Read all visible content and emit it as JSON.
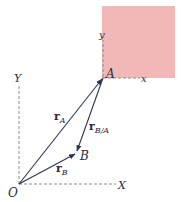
{
  "diagram": {
    "type": "relative-position-vectors",
    "colors": {
      "body_fill": "#f2b8b8",
      "vector": "#2b3550",
      "axis": "#8a8a95",
      "text": "#2a2a3a"
    },
    "points": {
      "origin": "O",
      "a": "A",
      "b": "B"
    },
    "fixed_axes": {
      "x": "X",
      "y": "Y"
    },
    "moving_axes": {
      "x": "x",
      "y": "y"
    },
    "vectors": [
      {
        "id": "r_A",
        "base": "r",
        "sub": "A",
        "from": "O",
        "to": "A"
      },
      {
        "id": "r_B",
        "base": "r",
        "sub": "B",
        "from": "O",
        "to": "B"
      },
      {
        "id": "r_B/A",
        "base": "r",
        "sub": "B/A",
        "from": "A",
        "to": "B"
      }
    ]
  }
}
